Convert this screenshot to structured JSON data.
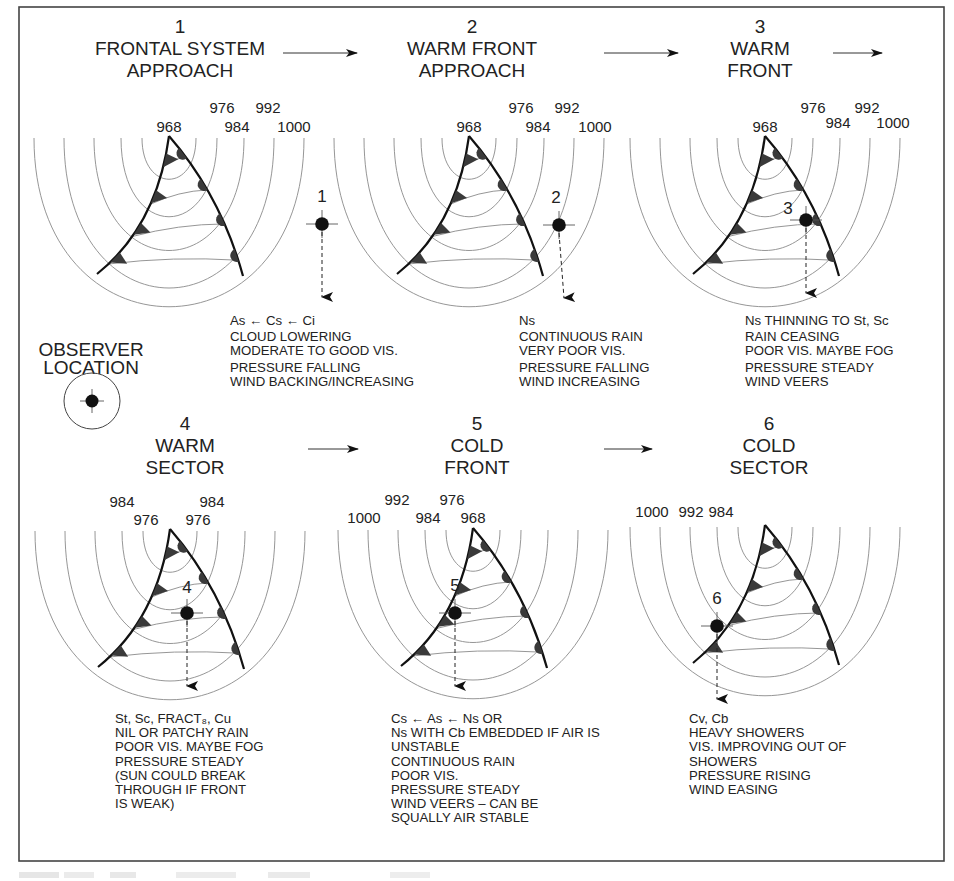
{
  "frame": {
    "x": 19,
    "y": 7,
    "w": 925,
    "h": 854,
    "stroke": "#444444"
  },
  "colors": {
    "ink": "#111111",
    "isobar": "#8a8a8a",
    "symbol": "#3a3a3a",
    "text": "#222222"
  },
  "flow_arrows": [
    {
      "x1": 283,
      "y1": 53,
      "x2": 357,
      "y2": 53
    },
    {
      "x1": 604,
      "y1": 53,
      "x2": 678,
      "y2": 53
    },
    {
      "x1": 833,
      "y1": 53,
      "x2": 882,
      "y2": 53
    },
    {
      "x1": 308,
      "y1": 449,
      "x2": 358,
      "y2": 449
    },
    {
      "x1": 604,
      "y1": 449,
      "x2": 652,
      "y2": 449
    }
  ],
  "legend": {
    "title_lines": [
      "OBSERVER",
      "LOCATION"
    ],
    "title_x": 91,
    "title_y": 356,
    "circle": {
      "cx": 92,
      "cy": 401,
      "r": 28
    }
  },
  "panels": [
    {
      "id": 1,
      "number": "1",
      "title_lines": [
        "FRONTAL SYSTEM",
        "APPROACH"
      ],
      "title_x": 180,
      "title_y": 33,
      "apex": {
        "x": 169,
        "y": 136
      },
      "isobar_labels": [
        {
          "text": "968",
          "x": 169,
          "y": 132
        },
        {
          "text": "976",
          "x": 222,
          "y": 113
        },
        {
          "text": "984",
          "x": 237,
          "y": 132
        },
        {
          "text": "992",
          "x": 268,
          "y": 113
        },
        {
          "text": "1000",
          "x": 294,
          "y": 132
        }
      ],
      "observer": {
        "label": "1",
        "x": 322,
        "y": 224,
        "label_dx": 0,
        "label_dy": -22
      },
      "desc_x": 230,
      "desc_y": 325,
      "desc_lines": [
        "As ← Cs ← Ci",
        "CLOUD LOWERING",
        "MODERATE TO GOOD VIS.",
        "PRESSURE FALLING",
        "WIND BACKING/INCREASING"
      ],
      "desc_gap_after": [
        0,
        2
      ]
    },
    {
      "id": 2,
      "number": "2",
      "title_lines": [
        "WARM FRONT",
        "APPROACH"
      ],
      "title_x": 472,
      "title_y": 33,
      "apex": {
        "x": 469,
        "y": 136
      },
      "isobar_labels": [
        {
          "text": "968",
          "x": 469,
          "y": 132
        },
        {
          "text": "976",
          "x": 521,
          "y": 113
        },
        {
          "text": "984",
          "x": 538,
          "y": 132
        },
        {
          "text": "992",
          "x": 567,
          "y": 113
        },
        {
          "text": "1000",
          "x": 595,
          "y": 132
        }
      ],
      "observer": {
        "label": "2",
        "x": 559,
        "y": 225,
        "label_dx": -3,
        "label_dy": -22
      },
      "desc_x": 519,
      "desc_y": 325,
      "desc_lines": [
        "Ns",
        "CONTINUOUS RAIN",
        "VERY POOR VIS.",
        "PRESSURE FALLING",
        "WIND INCREASING"
      ],
      "desc_gap_after": [
        0,
        2
      ]
    },
    {
      "id": 3,
      "number": "3",
      "title_lines": [
        "WARM",
        "FRONT"
      ],
      "title_x": 760,
      "title_y": 33,
      "apex": {
        "x": 765,
        "y": 136
      },
      "isobar_labels": [
        {
          "text": "968",
          "x": 765,
          "y": 132
        },
        {
          "text": "976",
          "x": 813,
          "y": 113
        },
        {
          "text": "984",
          "x": 838,
          "y": 128
        },
        {
          "text": "992",
          "x": 867,
          "y": 113
        },
        {
          "text": "1000",
          "x": 893,
          "y": 128
        }
      ],
      "observer": {
        "label": "3",
        "x": 806,
        "y": 220,
        "label_dx": -18,
        "label_dy": -6
      },
      "desc_x": 745,
      "desc_y": 325,
      "desc_lines": [
        "Ns THINNING TO St, Sc",
        "RAIN CEASING",
        "POOR VIS. MAYBE FOG",
        "PRESSURE STEADY",
        "WIND VEERS"
      ],
      "desc_gap_after": [
        0,
        2
      ]
    },
    {
      "id": 4,
      "number": "4",
      "title_lines": [
        "WARM",
        "SECTOR"
      ],
      "title_x": 185,
      "title_y": 430,
      "apex": {
        "x": 170,
        "y": 529
      },
      "isobar_labels": [
        {
          "text": "984",
          "x": 122,
          "y": 507
        },
        {
          "text": "976",
          "x": 146,
          "y": 525
        },
        {
          "text": "984",
          "x": 212,
          "y": 507
        },
        {
          "text": "976",
          "x": 198,
          "y": 525
        }
      ],
      "observer": {
        "label": "4",
        "x": 187,
        "y": 613,
        "label_dx": 0,
        "label_dy": -20
      },
      "desc_x": 115,
      "desc_y": 723,
      "desc_lines": [
        "St, Sc, FRACT₈, Cu",
        "NIL OR PATCHY RAIN",
        "POOR VIS. MAYBE FOG",
        "PRESSURE STEADY",
        "(SUN COULD BREAK",
        "THROUGH IF FRONT",
        "IS WEAK)"
      ],
      "desc_gap_after": []
    },
    {
      "id": 5,
      "number": "5",
      "title_lines": [
        "COLD",
        "FRONT"
      ],
      "title_x": 477,
      "title_y": 430,
      "apex": {
        "x": 473,
        "y": 528
      },
      "isobar_labels": [
        {
          "text": "992",
          "x": 397,
          "y": 505
        },
        {
          "text": "976",
          "x": 452,
          "y": 505
        },
        {
          "text": "1000",
          "x": 364,
          "y": 523
        },
        {
          "text": "984",
          "x": 428,
          "y": 523
        },
        {
          "text": "968",
          "x": 473,
          "y": 523
        }
      ],
      "observer": {
        "label": "5",
        "x": 455,
        "y": 613,
        "label_dx": 0,
        "label_dy": -22
      },
      "desc_x": 391,
      "desc_y": 723,
      "desc_lines": [
        "Cs ← As ← Ns OR",
        "Ns WITH Cb EMBEDDED IF AIR IS",
        "UNSTABLE",
        "CONTINUOUS RAIN",
        "POOR VIS.",
        "PRESSURE STEADY",
        "WIND VEERS – CAN BE",
        "SQUALLY AIR  STABLE"
      ],
      "desc_gap_after": []
    },
    {
      "id": 6,
      "number": "6",
      "title_lines": [
        "COLD",
        "SECTOR"
      ],
      "title_x": 769,
      "title_y": 430,
      "apex": {
        "x": 765,
        "y": 525
      },
      "isobar_labels": [
        {
          "text": "1000",
          "x": 652,
          "y": 517
        },
        {
          "text": "992",
          "x": 691,
          "y": 517
        },
        {
          "text": "984",
          "x": 721,
          "y": 517
        }
      ],
      "observer": {
        "label": "6",
        "x": 717,
        "y": 626,
        "label_dx": 0,
        "label_dy": -22
      },
      "desc_x": 689,
      "desc_y": 723,
      "desc_lines": [
        "Cv, Cb",
        "HEAVY SHOWERS",
        "VIS. IMPROVING OUT OF",
        "SHOWERS",
        "PRESSURE RISING",
        "WIND EASING"
      ],
      "desc_gap_after": []
    }
  ]
}
